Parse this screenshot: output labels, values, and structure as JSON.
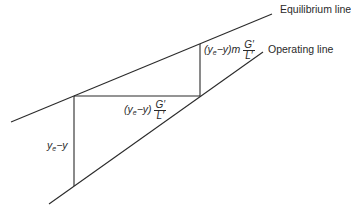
{
  "diagram": {
    "type": "graphical stage construction between equilibrium and operating lines",
    "lines": {
      "equilibrium_label": "Equilibrium line",
      "operating_label": "Operating line"
    },
    "labels": {
      "vertical_left": {
        "base": "y",
        "sub": "e",
        "rest": "−y"
      },
      "horizontal": {
        "prefix": "(y",
        "sub": "e",
        "mid": "−y)",
        "frac_num": "G′",
        "frac_den": "L′"
      },
      "vertical_right": {
        "prefix": "(y",
        "sub": "e",
        "mid": "−y)m",
        "frac_num": "G′",
        "frac_den": "L′"
      }
    },
    "colors": {
      "line": "#2a2a2a",
      "background": "#ffffff"
    }
  }
}
